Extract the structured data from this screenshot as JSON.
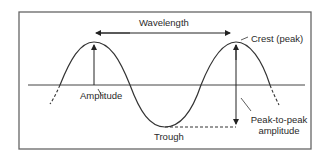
{
  "diagram": {
    "type": "wave-anatomy",
    "labels": {
      "wavelength": "Wavelength",
      "crest": "Crest (peak)",
      "amplitude": "Amplitude",
      "trough": "Trough",
      "peak_to_peak_line1": "Peak-to-peak",
      "peak_to_peak_line2": "amplitude"
    },
    "colors": {
      "stroke": "#333333",
      "frame": "#666666",
      "text": "#2a2a2a",
      "background": "#ffffff"
    }
  }
}
